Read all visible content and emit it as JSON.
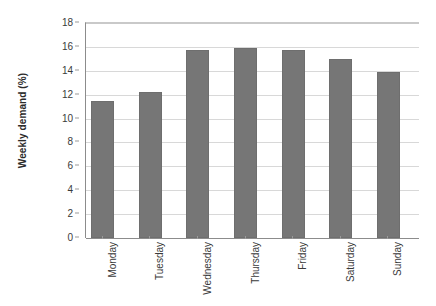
{
  "chart_data": {
    "type": "bar",
    "title": "",
    "subtitle": "",
    "xlabel": "",
    "ylabel": "Weekly demand (%)",
    "categories": [
      "Monday",
      "Tuesday",
      "Wednesday",
      "Thursday",
      "Friday",
      "Saturday",
      "Sunday"
    ],
    "values": [
      11.5,
      12.2,
      15.7,
      15.95,
      15.7,
      15.0,
      13.9
    ],
    "ylim": [
      0,
      18
    ],
    "ytick_labels": [
      "0",
      "2",
      "4",
      "6",
      "8",
      "10",
      "12",
      "14",
      "16",
      "18"
    ],
    "ytick_values": [
      0,
      2,
      4,
      6,
      8,
      10,
      12,
      14,
      16,
      18
    ],
    "grid": true,
    "grid_axis": "y",
    "legend": false,
    "legend_position": "none",
    "series": [
      {
        "name": "Weekly demand",
        "values": [
          11.5,
          12.2,
          15.7,
          15.95,
          15.7,
          15.0,
          13.9
        ]
      }
    ]
  },
  "style": {
    "bar_color": "#767676",
    "bar_border_color": "#6e6e6e",
    "gridline_color": "#d8d8d8",
    "axis_color": "#8c8c8c",
    "tick_text_color": "#3a3a3a",
    "axis_title_color": "#2b2b2b",
    "background_color": "#ffffff"
  }
}
